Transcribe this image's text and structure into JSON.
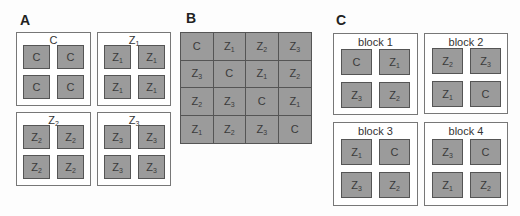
{
  "colors": {
    "cell_fill": "#9b9b9b",
    "cell_border": "#555555",
    "box_border": "#777777",
    "text": "#3a3a3a"
  },
  "panels": {
    "A": {
      "label": "A",
      "boxes": [
        {
          "title": "C",
          "title_sub": "",
          "cells": [
            [
              "C",
              ""
            ],
            [
              "C",
              ""
            ],
            [
              "C",
              ""
            ],
            [
              "C",
              ""
            ]
          ]
        },
        {
          "title": "Z",
          "title_sub": "1",
          "cells": [
            [
              "Z",
              "1"
            ],
            [
              "Z",
              "1"
            ],
            [
              "Z",
              "1"
            ],
            [
              "Z",
              "1"
            ]
          ]
        },
        {
          "title": "Z",
          "title_sub": "2",
          "cells": [
            [
              "Z",
              "2"
            ],
            [
              "Z",
              "2"
            ],
            [
              "Z",
              "2"
            ],
            [
              "Z",
              "2"
            ]
          ]
        },
        {
          "title": "Z",
          "title_sub": "3",
          "cells": [
            [
              "Z",
              "3"
            ],
            [
              "Z",
              "3"
            ],
            [
              "Z",
              "3"
            ],
            [
              "Z",
              "3"
            ]
          ]
        }
      ]
    },
    "B": {
      "label": "B",
      "grid": [
        [
          [
            "C",
            ""
          ],
          [
            "Z",
            "1"
          ],
          [
            "Z",
            "2"
          ],
          [
            "Z",
            "3"
          ]
        ],
        [
          [
            "Z",
            "3"
          ],
          [
            "C",
            ""
          ],
          [
            "Z",
            "1"
          ],
          [
            "Z",
            "2"
          ]
        ],
        [
          [
            "Z",
            "2"
          ],
          [
            "Z",
            "3"
          ],
          [
            "C",
            ""
          ],
          [
            "Z",
            "1"
          ]
        ],
        [
          [
            "Z",
            "1"
          ],
          [
            "Z",
            "2"
          ],
          [
            "Z",
            "3"
          ],
          [
            "C",
            ""
          ]
        ]
      ]
    },
    "C": {
      "label": "C",
      "boxes": [
        {
          "title": "block 1",
          "cells": [
            [
              "C",
              ""
            ],
            [
              "Z",
              "1"
            ],
            [
              "Z",
              "3"
            ],
            [
              "Z",
              "2"
            ]
          ]
        },
        {
          "title": "block 2",
          "cells": [
            [
              "Z",
              "2"
            ],
            [
              "Z",
              "3"
            ],
            [
              "Z",
              "1"
            ],
            [
              "C",
              ""
            ]
          ]
        },
        {
          "title": "block 3",
          "cells": [
            [
              "Z",
              "1"
            ],
            [
              "C",
              ""
            ],
            [
              "Z",
              "3"
            ],
            [
              "Z",
              "2"
            ]
          ]
        },
        {
          "title": "block 4",
          "cells": [
            [
              "Z",
              "3"
            ],
            [
              "C",
              ""
            ],
            [
              "Z",
              "1"
            ],
            [
              "Z",
              "2"
            ]
          ]
        }
      ]
    }
  }
}
